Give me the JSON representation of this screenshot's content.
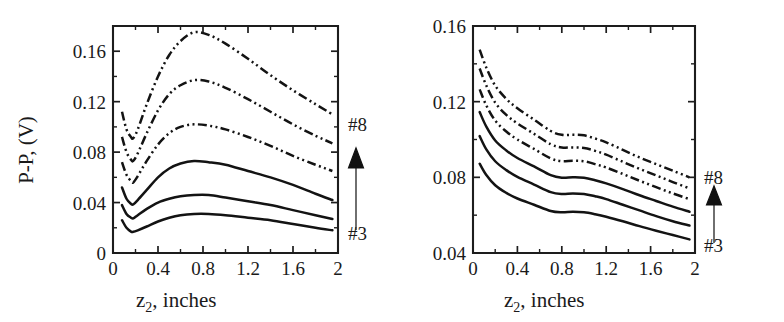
{
  "figure": {
    "panel_count": 2,
    "line_color": "#131313",
    "background": "#ffffff"
  },
  "panels": [
    {
      "id": "left-panel",
      "xlabel_main": "z",
      "xlabel_sub": "2",
      "xlabel_rest": ", inches",
      "ylabel": "P-P, (V)",
      "xticklabels": [
        "0",
        "0.4",
        "0.8",
        "1.2",
        "1.6",
        "2"
      ],
      "yticklabels": [
        "0",
        "0.04",
        "0.08",
        "0.12",
        "0.16"
      ],
      "series_top_label": "#8",
      "series_bottom_label": "#3",
      "arrow_icon": "up-arrow-icon"
    },
    {
      "id": "right-panel",
      "xlabel_main": "z",
      "xlabel_sub": "2",
      "xlabel_rest": ", inches",
      "ylabel": "",
      "xticklabels": [
        "0",
        "0.4",
        "0.8",
        "1.2",
        "1.6",
        "2"
      ],
      "yticklabels": [
        "0.04",
        "0.08",
        "0.12",
        "0.16"
      ],
      "series_top_label": "#8",
      "series_bottom_label": "#3",
      "arrow_icon": "up-arrow-icon"
    }
  ],
  "chart_data": [
    {
      "type": "line",
      "title": "",
      "panel": "left",
      "xlabel": "z2, inches",
      "ylabel": "P-P, (V)",
      "xlim": [
        0,
        2.0
      ],
      "ylim": [
        0,
        0.18
      ],
      "xticks": [
        0,
        0.4,
        0.8,
        1.2,
        1.6,
        2.0
      ],
      "yticks": [
        0,
        0.04,
        0.08,
        0.12,
        0.16
      ],
      "yminorticks": [
        0.02,
        0.06,
        0.1,
        0.14,
        0.18
      ],
      "grid": false,
      "legend": "none",
      "annotations": [
        {
          "text": "#8",
          "x": 2.05,
          "y": 0.112,
          "note": "top series marker"
        },
        {
          "text": "#3",
          "x": 2.05,
          "y": 0.026,
          "note": "bottom series marker"
        },
        {
          "text": "arrow-up",
          "x": 2.1,
          "y": 0.07,
          "note": "series order increases upward #3 to #8"
        }
      ],
      "x": [
        0.08,
        0.12,
        0.16,
        0.18,
        0.22,
        0.3,
        0.4,
        0.5,
        0.6,
        0.72,
        0.85,
        1.0,
        1.2,
        1.4,
        1.6,
        1.8,
        1.95
      ],
      "series": [
        {
          "name": "#8",
          "style": "dashdot",
          "values": [
            0.112,
            0.098,
            0.092,
            0.091,
            0.098,
            0.118,
            0.14,
            0.157,
            0.168,
            0.175,
            0.173,
            0.166,
            0.154,
            0.141,
            0.129,
            0.118,
            0.11
          ]
        },
        {
          "name": "#7",
          "style": "dashdot",
          "values": [
            0.092,
            0.08,
            0.074,
            0.073,
            0.079,
            0.095,
            0.113,
            0.126,
            0.133,
            0.137,
            0.136,
            0.131,
            0.122,
            0.112,
            0.102,
            0.093,
            0.087
          ]
        },
        {
          "name": "#6",
          "style": "dashdot",
          "values": [
            0.072,
            0.062,
            0.057,
            0.056,
            0.061,
            0.073,
            0.086,
            0.095,
            0.1,
            0.102,
            0.101,
            0.098,
            0.092,
            0.085,
            0.077,
            0.07,
            0.065
          ]
        },
        {
          "name": "#5",
          "style": "solid",
          "values": [
            0.052,
            0.043,
            0.039,
            0.0385,
            0.042,
            0.05,
            0.06,
            0.067,
            0.071,
            0.073,
            0.072,
            0.07,
            0.065,
            0.06,
            0.054,
            0.047,
            0.042
          ]
        },
        {
          "name": "#4",
          "style": "solid",
          "values": [
            0.038,
            0.031,
            0.028,
            0.0275,
            0.03,
            0.035,
            0.04,
            0.043,
            0.045,
            0.046,
            0.046,
            0.044,
            0.041,
            0.038,
            0.034,
            0.03,
            0.027
          ]
        },
        {
          "name": "#3",
          "style": "solid",
          "values": [
            0.026,
            0.02,
            0.017,
            0.0168,
            0.018,
            0.021,
            0.025,
            0.028,
            0.03,
            0.031,
            0.031,
            0.03,
            0.028,
            0.026,
            0.023,
            0.02,
            0.018
          ]
        }
      ]
    },
    {
      "type": "line",
      "title": "",
      "panel": "right",
      "xlabel": "z2, inches",
      "ylabel": "",
      "xlim": [
        0,
        2.0
      ],
      "ylim": [
        0.04,
        0.16
      ],
      "xticks": [
        0,
        0.4,
        0.8,
        1.2,
        1.6,
        2.0
      ],
      "yticks": [
        0.04,
        0.08,
        0.12,
        0.16
      ],
      "yminorticks": [
        0.06,
        0.1,
        0.14
      ],
      "grid": false,
      "legend": "none",
      "annotations": [
        {
          "text": "#8",
          "x": 2.05,
          "y": 0.079,
          "note": "top series marker"
        },
        {
          "text": "#3",
          "x": 2.05,
          "y": 0.046,
          "note": "bottom series marker"
        },
        {
          "text": "arrow-up",
          "x": 2.1,
          "y": 0.063,
          "note": "series order increases upward #3 to #8"
        }
      ],
      "x": [
        0.06,
        0.12,
        0.2,
        0.3,
        0.4,
        0.55,
        0.7,
        0.8,
        0.9,
        1.0,
        1.1,
        1.2,
        1.35,
        1.5,
        1.65,
        1.8,
        1.95
      ],
      "series": [
        {
          "name": "#8",
          "style": "dashdot",
          "values": [
            0.1475,
            0.138,
            0.1285,
            0.1215,
            0.1165,
            0.1105,
            0.1045,
            0.1025,
            0.1025,
            0.1022,
            0.1005,
            0.0985,
            0.0945,
            0.0905,
            0.087,
            0.0835,
            0.08
          ]
        },
        {
          "name": "#7",
          "style": "dashdot",
          "values": [
            0.1375,
            0.1285,
            0.1195,
            0.113,
            0.1085,
            0.103,
            0.0975,
            0.0958,
            0.0958,
            0.0955,
            0.094,
            0.092,
            0.0882,
            0.0845,
            0.081,
            0.0775,
            0.0742
          ]
        },
        {
          "name": "#6",
          "style": "dashdot",
          "values": [
            0.1265,
            0.118,
            0.11,
            0.1042,
            0.1,
            0.095,
            0.09,
            0.0885,
            0.0888,
            0.0885,
            0.087,
            0.0852,
            0.0818,
            0.0782,
            0.0748,
            0.0715,
            0.0685
          ]
        },
        {
          "name": "#5",
          "style": "solid",
          "values": [
            0.1145,
            0.1068,
            0.0995,
            0.0942,
            0.0902,
            0.0858,
            0.0812,
            0.0798,
            0.08,
            0.0798,
            0.0785,
            0.0768,
            0.0738,
            0.0705,
            0.0675,
            0.0645,
            0.0618
          ]
        },
        {
          "name": "#4",
          "style": "solid",
          "values": [
            0.1018,
            0.0948,
            0.0885,
            0.0838,
            0.0802,
            0.0762,
            0.0722,
            0.0712,
            0.0715,
            0.0712,
            0.07,
            0.0685,
            0.0655,
            0.0625,
            0.0595,
            0.0568,
            0.0545
          ]
        },
        {
          "name": "#3",
          "style": "solid",
          "values": [
            0.0872,
            0.0812,
            0.0758,
            0.0718,
            0.0688,
            0.0655,
            0.0622,
            0.0615,
            0.0618,
            0.0615,
            0.0605,
            0.0592,
            0.0568,
            0.0542,
            0.0518,
            0.0495,
            0.0472
          ]
        }
      ]
    }
  ]
}
